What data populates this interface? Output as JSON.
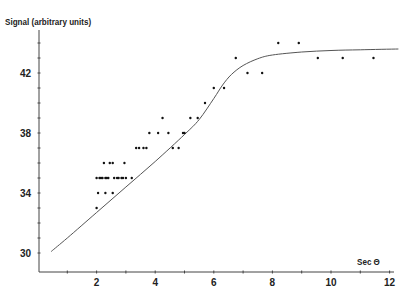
{
  "chart_data": {
    "type": "scatter",
    "title": "",
    "xlabel": "Sec Θ",
    "ylabel": "Signal (arbitrary units)",
    "xlim": [
      0,
      12.5
    ],
    "ylim": [
      28.8,
      45
    ],
    "x_ticks": [
      2,
      4,
      6,
      8,
      10,
      12
    ],
    "x_minor_ticks": [
      1,
      3,
      5,
      7,
      9,
      11
    ],
    "y_ticks": [
      30,
      34,
      38,
      42
    ],
    "y_minor_ticks": [
      31,
      32,
      33,
      35,
      36,
      37,
      39,
      40,
      41,
      43,
      44
    ],
    "grid": false,
    "legend": null,
    "series": [
      {
        "name": "measured",
        "kind": "points",
        "points": [
          [
            2.0,
            33
          ],
          [
            2.05,
            34
          ],
          [
            2.3,
            34
          ],
          [
            2.55,
            34
          ],
          [
            2.0,
            35
          ],
          [
            2.1,
            35
          ],
          [
            2.15,
            35
          ],
          [
            2.2,
            35
          ],
          [
            2.3,
            35
          ],
          [
            2.35,
            35
          ],
          [
            2.4,
            35
          ],
          [
            2.6,
            35
          ],
          [
            2.7,
            35
          ],
          [
            2.75,
            35
          ],
          [
            2.85,
            35
          ],
          [
            2.9,
            35
          ],
          [
            3.0,
            35
          ],
          [
            3.2,
            35
          ],
          [
            2.25,
            36
          ],
          [
            2.45,
            36
          ],
          [
            2.55,
            36
          ],
          [
            2.95,
            36
          ],
          [
            3.35,
            37
          ],
          [
            3.45,
            37
          ],
          [
            3.6,
            37
          ],
          [
            3.7,
            37
          ],
          [
            4.6,
            37
          ],
          [
            4.8,
            37
          ],
          [
            3.8,
            38
          ],
          [
            4.1,
            38
          ],
          [
            4.45,
            38
          ],
          [
            4.95,
            38
          ],
          [
            5.0,
            38
          ],
          [
            4.25,
            39
          ],
          [
            5.2,
            39
          ],
          [
            5.45,
            39
          ],
          [
            5.7,
            40
          ],
          [
            6.0,
            41
          ],
          [
            6.35,
            41
          ],
          [
            6.75,
            43
          ],
          [
            7.15,
            42
          ],
          [
            7.65,
            42
          ],
          [
            8.2,
            44
          ],
          [
            8.9,
            44
          ],
          [
            9.55,
            43
          ],
          [
            10.4,
            43
          ],
          [
            11.45,
            43
          ]
        ]
      },
      {
        "name": "fit",
        "kind": "line",
        "points": [
          [
            0.45,
            30.1
          ],
          [
            1.0,
            31.0
          ],
          [
            2.0,
            32.7
          ],
          [
            3.0,
            34.4
          ],
          [
            4.0,
            36.1
          ],
          [
            5.0,
            37.9
          ],
          [
            5.5,
            38.9
          ],
          [
            6.0,
            40.3
          ],
          [
            6.3,
            41.2
          ],
          [
            6.6,
            41.9
          ],
          [
            7.0,
            42.5
          ],
          [
            7.5,
            42.95
          ],
          [
            8.0,
            43.2
          ],
          [
            9.0,
            43.4
          ],
          [
            10.0,
            43.5
          ],
          [
            11.0,
            43.55
          ],
          [
            12.3,
            43.6
          ]
        ]
      }
    ]
  },
  "axes": {
    "y_label": "Signal (arbitrary units)",
    "x_label": "Sec Θ",
    "y_tick_labels": [
      "30",
      "34",
      "38",
      "42"
    ],
    "x_tick_labels": [
      "2",
      "4",
      "6",
      "8",
      "10",
      "12"
    ]
  },
  "style": {
    "axis_color": "#444444",
    "point_color": "#111111",
    "line_color": "#555555",
    "text_color": "#222222"
  }
}
